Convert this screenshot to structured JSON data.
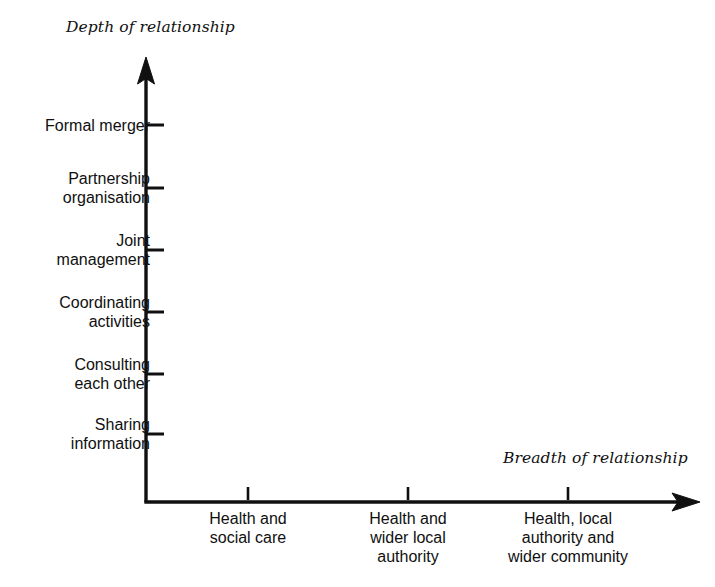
{
  "chart_data": {
    "type": "scatter",
    "title": "",
    "xlabel": "Breadth of relationship",
    "ylabel": "Depth of relationship",
    "grid": false,
    "legend": null,
    "series": [],
    "annotations": [],
    "y_axis": {
      "label": "Depth of relationship",
      "orientation": "vertical",
      "arrow": "up",
      "tick_labels": [
        "Formal merger",
        "Partnership organisation",
        "Joint management",
        "Coordinating activities",
        "Consulting each other",
        "Sharing information"
      ],
      "tick_label_lines": [
        [
          "Formal merger"
        ],
        [
          "Partnership",
          "organisation"
        ],
        [
          "Joint",
          "management"
        ],
        [
          "Coordinating",
          "activities"
        ],
        [
          "Consulting",
          "each other"
        ],
        [
          "Sharing",
          "information"
        ]
      ],
      "tick_y_px": [
        125,
        188,
        250,
        312,
        374,
        434
      ],
      "order": "increasing upward"
    },
    "x_axis": {
      "label": "Breadth of relationship",
      "orientation": "horizontal",
      "arrow": "right",
      "tick_labels": [
        "Health and social care",
        "Health and wider local authority",
        "Health, local authority and wider community"
      ],
      "tick_label_lines": [
        [
          "Health and",
          "social care"
        ],
        [
          "Health and",
          "wider local",
          "authority"
        ],
        [
          "Health, local",
          "authority and",
          "wider community"
        ]
      ],
      "tick_x_px": [
        248,
        408,
        568
      ],
      "order": "increasing rightward"
    }
  },
  "titles": {
    "depth": "Depth of relationship",
    "breadth": "Breadth of relationship"
  },
  "y_ticks": [
    {
      "id": "formal-merger",
      "line1": "Formal merger",
      "line2": "",
      "y": 125
    },
    {
      "id": "partnership-organisation",
      "line1": "Partnership",
      "line2": "organisation",
      "y": 188
    },
    {
      "id": "joint-management",
      "line1": "Joint",
      "line2": "management",
      "y": 250
    },
    {
      "id": "coordinating-activities",
      "line1": "Coordinating",
      "line2": "activities",
      "y": 312
    },
    {
      "id": "consulting-each-other",
      "line1": "Consulting",
      "line2": "each other",
      "y": 374
    },
    {
      "id": "sharing-information",
      "line1": "Sharing",
      "line2": "information",
      "y": 434
    }
  ],
  "x_ticks": [
    {
      "id": "health-and-social-care",
      "line1": "Health and",
      "line2": "social care",
      "line3": "",
      "x": 248
    },
    {
      "id": "health-and-wider-local-authority",
      "line1": "Health and",
      "line2": "wider local",
      "line3": "authority",
      "x": 408
    },
    {
      "id": "health-local-authority-and-wider-community",
      "line1": "Health, local",
      "line2": "authority and",
      "line3": "wider community",
      "x": 568
    }
  ],
  "colors": {
    "background": "#ffffff",
    "ink": "#101010",
    "axis": "#101010"
  }
}
